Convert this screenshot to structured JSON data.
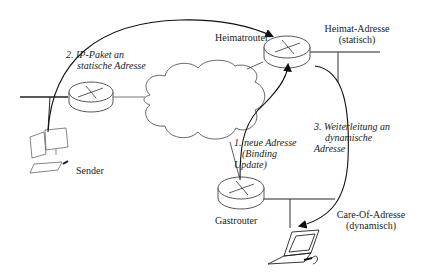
{
  "diagram": {
    "nodes": {
      "heimatrouter": {
        "label": "Heimatrouter"
      },
      "gastrouter": {
        "label": "Gastrouter"
      },
      "sender": {
        "label": "Sender"
      },
      "sender_router": {
        "label": ""
      },
      "internet": {
        "label": ""
      },
      "mobile_host": {
        "label": ""
      }
    },
    "addresses": {
      "home": {
        "line1": "Heimat-Adresse",
        "line2": "(statisch)"
      },
      "care_of": {
        "line1": "Care-Of-Adresse",
        "line2": "(dynamisch)"
      }
    },
    "steps": {
      "step1": {
        "line1": "1. neue Adresse",
        "line2": "(Binding",
        "line3": "Update)"
      },
      "step2": {
        "line1": "2. IP-Paket an",
        "line2": "statische Adresse"
      },
      "step3": {
        "line1": "3. Weiterleitung an",
        "line2": "dynamische",
        "line3": "Adresse"
      }
    },
    "colors": {
      "stroke": "#1a1a1a",
      "background": "#ffffff",
      "text": "#222222"
    }
  }
}
